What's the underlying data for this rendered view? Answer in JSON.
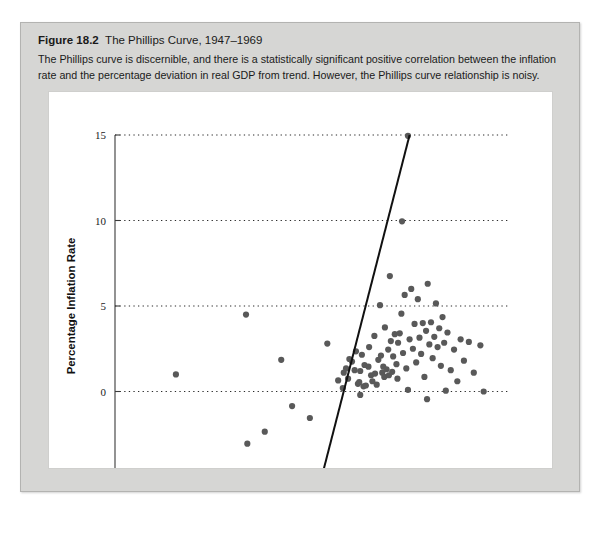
{
  "figure": {
    "label": "Figure 18.2",
    "title": "The Phillips Curve, 1947–1969",
    "description": "The Phillips curve is discernible, and there is a statistically significant positive correlation between the inflation rate and the percentage deviation in real GDP from trend. However, the Phillips curve relationship is noisy."
  },
  "chart_data": {
    "type": "scatter",
    "title": "The Phillips Curve, 1947–1969",
    "xlabel": "Percentage Deviation from Trend in GDP",
    "ylabel": "Percentage Inflation Rate",
    "xlim": [
      -8,
      4
    ],
    "ylim": [
      -5,
      15
    ],
    "xticks": [
      -8,
      -6,
      -4,
      -2,
      0,
      2,
      4
    ],
    "xtick_labels": [
      "–8",
      "–6",
      "–4",
      "–2",
      "0",
      "2",
      "4"
    ],
    "yticks": [
      -5,
      0,
      5,
      10,
      15
    ],
    "ytick_labels": [
      "–5",
      "0",
      "5",
      "10",
      "15"
    ],
    "gridlines_y": [
      0,
      5,
      10,
      15
    ],
    "grid": "horizontal-dotted",
    "legend": "none",
    "point_color": "#595959",
    "line_color": "#111111",
    "trendline": {
      "label": "regression line",
      "x_start": -1.72,
      "y_start": -5.0,
      "x_end": 0.95,
      "y_end": 15.0
    },
    "points": [
      {
        "x": -6.15,
        "y": 1.0
      },
      {
        "x": -4.02,
        "y": 4.5
      },
      {
        "x": -3.98,
        "y": -3.05
      },
      {
        "x": -3.95,
        "y": -4.75
      },
      {
        "x": -3.82,
        "y": -5.0
      },
      {
        "x": -3.45,
        "y": -2.35
      },
      {
        "x": -2.95,
        "y": 1.85
      },
      {
        "x": -2.62,
        "y": -0.85
      },
      {
        "x": -2.08,
        "y": -1.55
      },
      {
        "x": -1.55,
        "y": 2.8
      },
      {
        "x": -1.22,
        "y": 0.65
      },
      {
        "x": -1.08,
        "y": 0.2
      },
      {
        "x": -1.05,
        "y": 1.1
      },
      {
        "x": -0.98,
        "y": 1.35
      },
      {
        "x": -0.92,
        "y": 0.75
      },
      {
        "x": -0.88,
        "y": 1.9
      },
      {
        "x": -0.8,
        "y": 1.75
      },
      {
        "x": -0.72,
        "y": 1.25
      },
      {
        "x": -0.68,
        "y": 2.35
      },
      {
        "x": -0.62,
        "y": 0.45
      },
      {
        "x": -0.58,
        "y": 0.55
      },
      {
        "x": -0.55,
        "y": 1.2
      },
      {
        "x": -0.5,
        "y": 2.15
      },
      {
        "x": -0.45,
        "y": 0.3
      },
      {
        "x": -0.42,
        "y": 1.55
      },
      {
        "x": -0.38,
        "y": 0.35
      },
      {
        "x": -0.3,
        "y": 1.45
      },
      {
        "x": -0.28,
        "y": 2.6
      },
      {
        "x": -0.22,
        "y": 0.95
      },
      {
        "x": -0.18,
        "y": 0.6
      },
      {
        "x": -0.12,
        "y": 3.25
      },
      {
        "x": -0.1,
        "y": 1.05
      },
      {
        "x": -0.05,
        "y": 0.4
      },
      {
        "x": 0.0,
        "y": 1.85
      },
      {
        "x": 0.05,
        "y": 5.05
      },
      {
        "x": 0.08,
        "y": 2.1
      },
      {
        "x": 0.12,
        "y": 1.1
      },
      {
        "x": 0.15,
        "y": 1.45
      },
      {
        "x": 0.18,
        "y": 0.85
      },
      {
        "x": 0.2,
        "y": 3.75
      },
      {
        "x": 0.25,
        "y": 1.3
      },
      {
        "x": 0.3,
        "y": 2.45
      },
      {
        "x": 0.32,
        "y": 0.95
      },
      {
        "x": 0.35,
        "y": 6.75
      },
      {
        "x": 0.38,
        "y": 2.95
      },
      {
        "x": 0.42,
        "y": 1.15
      },
      {
        "x": 0.45,
        "y": 2.05
      },
      {
        "x": 0.5,
        "y": 3.35
      },
      {
        "x": 0.55,
        "y": 1.6
      },
      {
        "x": 0.58,
        "y": 0.75
      },
      {
        "x": 0.6,
        "y": 2.85
      },
      {
        "x": 0.65,
        "y": 3.4
      },
      {
        "x": 0.7,
        "y": 4.55
      },
      {
        "x": 0.72,
        "y": 9.95
      },
      {
        "x": 0.75,
        "y": 2.25
      },
      {
        "x": 0.8,
        "y": 5.65
      },
      {
        "x": 0.85,
        "y": 1.35
      },
      {
        "x": 0.9,
        "y": 14.95
      },
      {
        "x": 0.95,
        "y": 3.05
      },
      {
        "x": 1.0,
        "y": 6.0
      },
      {
        "x": 1.05,
        "y": 2.5
      },
      {
        "x": 1.1,
        "y": 3.95
      },
      {
        "x": 1.15,
        "y": 1.7
      },
      {
        "x": 1.2,
        "y": 5.4
      },
      {
        "x": 1.25,
        "y": 3.15
      },
      {
        "x": 1.3,
        "y": 2.2
      },
      {
        "x": 1.35,
        "y": 4.0
      },
      {
        "x": 1.4,
        "y": 0.85
      },
      {
        "x": 1.45,
        "y": 3.55
      },
      {
        "x": 1.5,
        "y": 6.3
      },
      {
        "x": 1.55,
        "y": 2.75
      },
      {
        "x": 1.6,
        "y": 4.05
      },
      {
        "x": 1.65,
        "y": 1.95
      },
      {
        "x": 1.7,
        "y": 3.2
      },
      {
        "x": 1.75,
        "y": 5.15
      },
      {
        "x": 1.8,
        "y": 2.6
      },
      {
        "x": 1.85,
        "y": 3.7
      },
      {
        "x": 1.9,
        "y": 1.5
      },
      {
        "x": 1.95,
        "y": 4.35
      },
      {
        "x": 2.0,
        "y": 2.85
      },
      {
        "x": 2.05,
        "y": 0.05
      },
      {
        "x": 2.1,
        "y": 3.45
      },
      {
        "x": 2.2,
        "y": 1.25
      },
      {
        "x": 2.3,
        "y": 2.45
      },
      {
        "x": 2.4,
        "y": 0.6
      },
      {
        "x": 2.5,
        "y": 3.05
      },
      {
        "x": 2.6,
        "y": 1.8
      },
      {
        "x": 2.75,
        "y": 2.9
      },
      {
        "x": 2.9,
        "y": 1.1
      },
      {
        "x": 3.1,
        "y": 2.7
      },
      {
        "x": 3.2,
        "y": 0.0
      },
      {
        "x": 1.48,
        "y": -0.45
      },
      {
        "x": -0.55,
        "y": -0.2
      },
      {
        "x": 0.9,
        "y": 0.1
      }
    ]
  }
}
